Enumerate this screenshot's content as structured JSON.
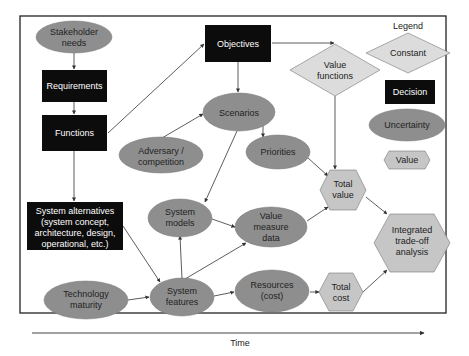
{
  "colors": {
    "decision_fill": "#0c0c0c",
    "uncertainty_fill": "#8e8e8e",
    "constant_fill": "#dcdcdc",
    "value_fill": "#c6c6c6",
    "line": "#333333",
    "frame": "#222222"
  },
  "nodes": {
    "stakeholder_needs": {
      "line1": "Stakeholder",
      "line2": "needs",
      "type": "uncertainty"
    },
    "requirements": {
      "label": "Requirements",
      "type": "decision"
    },
    "functions": {
      "label": "Functions",
      "type": "decision"
    },
    "system_alternatives": {
      "line1": "System alternatives",
      "line2": "(system concept,",
      "line3": "architecture, design,",
      "line4": "operational, etc.)",
      "type": "decision"
    },
    "technology_maturity": {
      "line1": "Technology",
      "line2": "maturity",
      "type": "uncertainty"
    },
    "objectives": {
      "label": "Objectives",
      "type": "decision"
    },
    "scenarios": {
      "label": "Scenarios",
      "type": "uncertainty"
    },
    "adversary": {
      "line1": "Adversary /",
      "line2": "competition",
      "type": "uncertainty"
    },
    "priorities": {
      "label": "Priorities",
      "type": "uncertainty"
    },
    "system_models": {
      "line1": "System",
      "line2": "models",
      "type": "uncertainty"
    },
    "value_measure_data": {
      "line1": "Value",
      "line2": "measure",
      "line3": "data",
      "type": "uncertainty"
    },
    "system_features": {
      "line1": "System",
      "line2": "features",
      "type": "uncertainty"
    },
    "resources": {
      "line1": "Resources",
      "line2": "(cost)",
      "type": "uncertainty"
    },
    "value_functions": {
      "line1": "Value",
      "line2": "functions",
      "type": "constant"
    },
    "total_value": {
      "line1": "Total",
      "line2": "value",
      "type": "value"
    },
    "total_cost": {
      "line1": "Total",
      "line2": "cost",
      "type": "value"
    },
    "integrated": {
      "line1": "Integrated",
      "line2": "trade-off",
      "line3": "analysis",
      "type": "value"
    }
  },
  "edges": [
    [
      "stakeholder_needs",
      "requirements"
    ],
    [
      "requirements",
      "functions"
    ],
    [
      "functions",
      "system_alternatives"
    ],
    [
      "functions",
      "objectives"
    ],
    [
      "objectives",
      "scenarios"
    ],
    [
      "objectives",
      "value_functions"
    ],
    [
      "adversary",
      "scenarios"
    ],
    [
      "scenarios",
      "priorities"
    ],
    [
      "scenarios",
      "system_models"
    ],
    [
      "value_functions",
      "total_value"
    ],
    [
      "priorities",
      "total_value"
    ],
    [
      "system_models",
      "value_measure_data"
    ],
    [
      "system_alternatives",
      "system_features"
    ],
    [
      "technology_maturity",
      "system_features"
    ],
    [
      "system_features",
      "system_models"
    ],
    [
      "system_features",
      "value_measure_data"
    ],
    [
      "system_features",
      "resources"
    ],
    [
      "value_measure_data",
      "total_value"
    ],
    [
      "resources",
      "total_cost"
    ],
    [
      "total_value",
      "integrated"
    ],
    [
      "total_cost",
      "integrated"
    ]
  ],
  "legend": {
    "title": "Legend",
    "constant": "Constant",
    "decision": "Decision",
    "uncertainty": "Uncertainty",
    "value": "Value"
  },
  "time_axis": {
    "label": "Time"
  }
}
